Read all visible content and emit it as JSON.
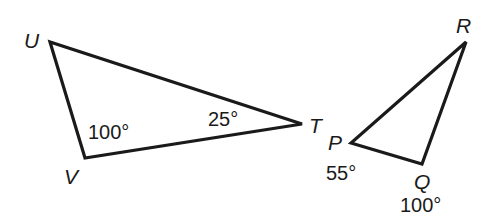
{
  "figure": {
    "type": "geometry-diagram",
    "background_color": "#ffffff",
    "stroke_color": "#1a1a1a",
    "shapes": [
      {
        "name": "triangle-uvt",
        "kind": "triangle",
        "vertices": [
          {
            "label": "U",
            "x": 50,
            "y": 42,
            "label_x": 24,
            "label_y": 48
          },
          {
            "label": "V",
            "x": 85,
            "y": 158,
            "label_x": 64,
            "label_y": 184
          },
          {
            "label": "T",
            "x": 302,
            "y": 124,
            "label_x": 309,
            "label_y": 133
          }
        ],
        "angle_labels": [
          {
            "name": "angle-v",
            "text": "100°",
            "x": 88,
            "y": 139
          },
          {
            "name": "angle-t",
            "text": "25°",
            "x": 208,
            "y": 126
          }
        ]
      },
      {
        "name": "triangle-pqr",
        "kind": "triangle",
        "vertices": [
          {
            "label": "P",
            "x": 351,
            "y": 143,
            "label_x": 328,
            "label_y": 150
          },
          {
            "label": "Q",
            "x": 422,
            "y": 164,
            "label_x": 414,
            "label_y": 189
          },
          {
            "label": "R",
            "x": 466,
            "y": 42,
            "label_x": 456,
            "label_y": 33
          }
        ],
        "angle_labels": [
          {
            "name": "angle-p",
            "text": "55°",
            "x": 326,
            "y": 180
          },
          {
            "name": "angle-q",
            "text": "100°",
            "x": 400,
            "y": 212
          }
        ]
      }
    ]
  }
}
